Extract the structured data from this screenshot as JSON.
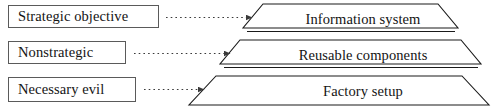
{
  "diagram": {
    "colors": {
      "line": "#1a1a1a",
      "box_border": "#5a5a5a",
      "text": "#141414",
      "background": "#ffffff",
      "arrow": "#3a3a3a"
    },
    "left_labels": [
      {
        "text": "Strategic objective",
        "icon": "text-box"
      },
      {
        "text": "Nonstrategic",
        "icon": "text-box"
      },
      {
        "text": "Necessary evil",
        "icon": "text-box"
      }
    ],
    "connectors": [
      {
        "style": "dotted",
        "arrowhead": "solid-triangle",
        "direction": "right",
        "from": "Strategic objective",
        "to": "Information system"
      },
      {
        "style": "dotted",
        "arrowhead": "solid-triangle",
        "direction": "right",
        "from": "Nonstrategic",
        "to": "Reusable components"
      },
      {
        "style": "dotted",
        "arrowhead": "solid-triangle",
        "direction": "right",
        "from": "Necessary evil",
        "to": "Factory setup"
      }
    ],
    "pyramid": {
      "shape": "three-tier-trapezoid-stack",
      "tiers": [
        {
          "level": 1,
          "position": "apex",
          "text": "Information system"
        },
        {
          "level": 2,
          "position": "middle",
          "text": "Reusable components"
        },
        {
          "level": 3,
          "position": "base",
          "text": "Factory setup"
        }
      ]
    }
  }
}
